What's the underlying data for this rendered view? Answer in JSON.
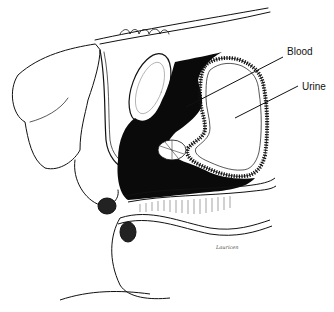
{
  "figure": {
    "labels": [
      {
        "text": "Blood",
        "x": 287,
        "y": 46,
        "pointer_from": [
          283,
          57
        ],
        "pointer_to": [
          186,
          107
        ]
      },
      {
        "text": "Urine",
        "x": 302,
        "y": 81,
        "pointer_from": [
          298,
          86
        ],
        "pointer_to": [
          235,
          118
        ]
      }
    ],
    "signature": "Lauricen",
    "colors": {
      "ink": "#111111",
      "background": "#ffffff",
      "fill_dark": "#0a0a0a"
    }
  }
}
